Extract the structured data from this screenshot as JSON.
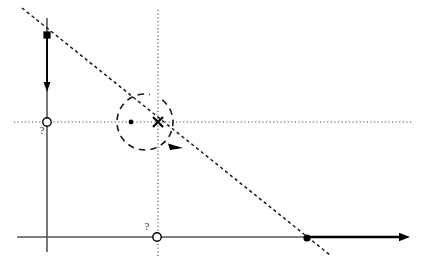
{
  "figure": {
    "kind": "geometry-diagram",
    "width": 421,
    "height": 263,
    "background_color": "#ffffff",
    "ink_color": "#000000",
    "faint_ink_color": "#6a6a6a",
    "label_color": "#3a3a3a",
    "unknown_marker_label_1": "?",
    "unknown_marker_label_2": "?"
  },
  "axes": {
    "horizontal_axis": {
      "name": "horizontal-axis",
      "y": 237,
      "x_start": 17,
      "x_end": 410,
      "has_arrowhead_right": true,
      "thin_segment_color": "#555555",
      "thick_segment_color": "#000000",
      "thickness_change_x": 307
    },
    "vertical_line": {
      "name": "vertical-line",
      "x": 47,
      "y_top": 18,
      "y_bottom": 252,
      "color": "#555555"
    }
  },
  "guides": {
    "horizontal_dotted": {
      "name": "horizontal-dotted-guide",
      "y": 122,
      "x_start": 14,
      "x_end": 413
    },
    "vertical_dotted": {
      "name": "vertical-dotted-guide",
      "x": 158,
      "y_start": 10,
      "y_end": 258
    }
  },
  "diagonal_line": {
    "name": "dashed-diagonal-line",
    "x1": 22,
    "y1": 8,
    "x2": 330,
    "y2": 255,
    "style": "dashed"
  },
  "vector_arrow": {
    "name": "downward-vector-arrow",
    "x": 47,
    "y_tail": 35,
    "y_tip": 92,
    "direction": "down"
  },
  "rotation_arc": {
    "name": "rotation-arc",
    "center_x": 145,
    "center_y": 122,
    "radius": 28,
    "style": "dashed",
    "direction": "clockwise",
    "arrow_x": 176,
    "arrow_y": 147
  },
  "markers": [
    {
      "name": "filled-point-top",
      "type": "filled-square",
      "x": 47,
      "y": 35,
      "label": ""
    },
    {
      "name": "open-point-left",
      "type": "open-circle",
      "x": 47,
      "y": 122,
      "label": "?",
      "label_x": 42,
      "label_y": 134
    },
    {
      "name": "filled-point-arc-left",
      "type": "filled-dot",
      "x": 131,
      "y": 122,
      "label": ""
    },
    {
      "name": "cross-point-center",
      "type": "cross",
      "x": 158,
      "y": 122,
      "label": ""
    },
    {
      "name": "open-point-bottom",
      "type": "open-circle",
      "x": 157,
      "y": 237,
      "label": "?",
      "label_x": 147,
      "label_y": 230
    },
    {
      "name": "filled-point-right",
      "type": "filled-dot",
      "x": 307,
      "y": 238,
      "label": ""
    }
  ]
}
